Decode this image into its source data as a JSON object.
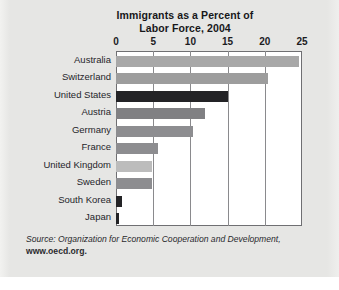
{
  "figure": {
    "background_color": "#e6e6e4",
    "plot_background_color": "#ffffff",
    "frame_color": "#6f6f72"
  },
  "source": {
    "prefix": "Source: Organization for Economic Cooperation and Development,",
    "url": "www.oecd.org."
  },
  "chart_data": {
    "type": "bar",
    "orientation": "horizontal",
    "title": "Immigrants as a Percent of Labor Force, 2004",
    "title_line1": "Immigrants as a Percent of",
    "title_line2": "Labor Force, 2004",
    "xlabel": "",
    "ylabel": "",
    "xlim": [
      0,
      25
    ],
    "xticks": [
      0,
      5,
      10,
      15,
      20,
      25
    ],
    "xtick_labels": [
      "0",
      "5",
      "10",
      "15",
      "20",
      "25"
    ],
    "grid": true,
    "grid_axis": "x",
    "legend": false,
    "categories": [
      "Australia",
      "Switzerland",
      "United States",
      "Austria",
      "Germany",
      "France",
      "United Kingdom",
      "Sweden",
      "South Korea",
      "Japan"
    ],
    "values": [
      24.6,
      20.4,
      15.0,
      12.0,
      10.3,
      5.6,
      4.9,
      4.9,
      0.8,
      0.4
    ],
    "bar_colors": [
      "#a8a8a8",
      "#9d9d9d",
      "#232326",
      "#808083",
      "#8d8d90",
      "#8d8d90",
      "#bcbcbc",
      "#8d8d90",
      "#232326",
      "#232326"
    ]
  }
}
